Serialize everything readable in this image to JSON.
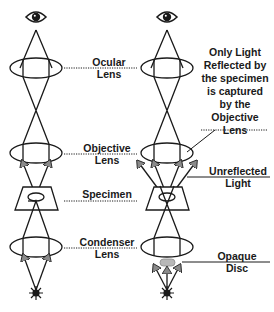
{
  "diagram": {
    "left_column": {
      "labels": {
        "ocular_lens": [
          "Ocular",
          "Lens"
        ],
        "objective_lens": [
          "Objective",
          "Lens"
        ],
        "specimen": [
          "Specimen"
        ],
        "condenser_lens": [
          "Condenser",
          "Lens"
        ]
      }
    },
    "right_column": {
      "labels": {
        "note": [
          "Only Light",
          "Reflected by",
          "the specimen",
          "is captured",
          "by the",
          "Objective",
          "Lens"
        ],
        "unreflected_light": [
          "Unreflected",
          "Light"
        ],
        "opaque_disc": [
          "Opaque",
          "Disc"
        ]
      }
    },
    "colors": {
      "line": "#1a1a1a",
      "arrow_fill": "#8a8a8a",
      "disc_fill": "#b8b8b8",
      "background": "#ffffff"
    },
    "icons": {
      "eye": "eye-icon",
      "light_source": "light-source-star-icon"
    }
  }
}
